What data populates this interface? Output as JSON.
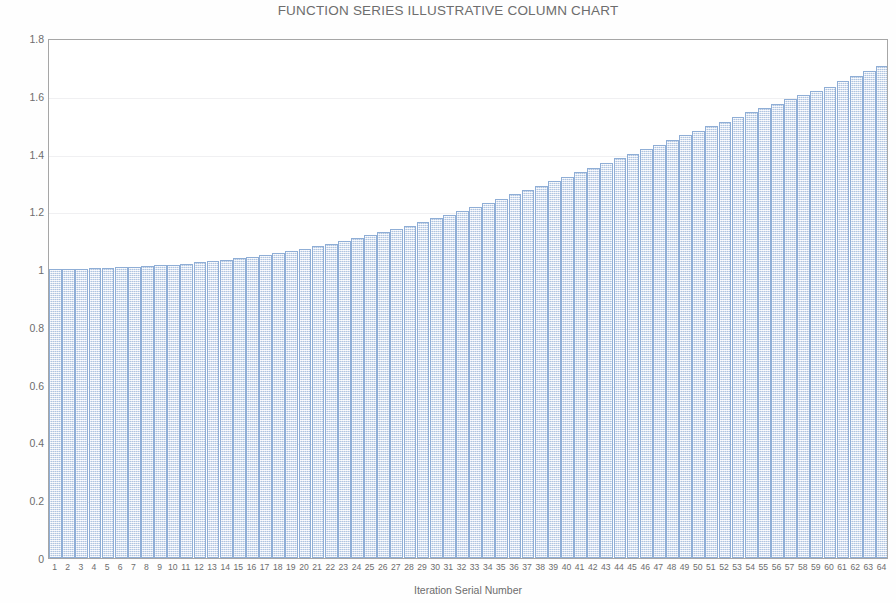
{
  "chart_data": {
    "type": "bar",
    "title": "FUNCTION SERIES ILLUSTRATIVE COLUMN CHART",
    "xlabel": "Iteration Serial Number",
    "ylabel": "Value of Iteration Kernel",
    "ylim": [
      0,
      1.8
    ],
    "ytick_labels": [
      "1.8",
      "1.6",
      "1.4",
      "1.2",
      "1",
      "0.8",
      "0.6",
      "0.4",
      "0.2",
      "0"
    ],
    "ytick_values": [
      1.8,
      1.6,
      1.4,
      1.2,
      1.0,
      0.8,
      0.6,
      0.4,
      0.2,
      0
    ],
    "grid": true,
    "legend": null,
    "legend_position": "none",
    "categories": [
      "1",
      "2",
      "3",
      "4",
      "5",
      "6",
      "7",
      "8",
      "9",
      "10",
      "11",
      "12",
      "13",
      "14",
      "15",
      "16",
      "17",
      "18",
      "19",
      "20",
      "21",
      "22",
      "23",
      "24",
      "25",
      "26",
      "27",
      "28",
      "29",
      "30",
      "31",
      "32",
      "33",
      "34",
      "35",
      "36",
      "37",
      "38",
      "39",
      "40",
      "41",
      "42",
      "43",
      "44",
      "45",
      "46",
      "47",
      "48",
      "49",
      "50",
      "51",
      "52",
      "53",
      "54",
      "55",
      "56",
      "57",
      "58",
      "59",
      "60",
      "61",
      "62",
      "63",
      "64"
    ],
    "values": [
      1.0,
      1.001,
      1.002,
      1.003,
      1.004,
      1.006,
      1.008,
      1.01,
      1.013,
      1.016,
      1.019,
      1.023,
      1.027,
      1.032,
      1.037,
      1.043,
      1.049,
      1.056,
      1.063,
      1.071,
      1.079,
      1.088,
      1.097,
      1.107,
      1.117,
      1.128,
      1.139,
      1.151,
      1.163,
      1.176,
      1.189,
      1.202,
      1.216,
      1.23,
      1.244,
      1.259,
      1.274,
      1.289,
      1.304,
      1.319,
      1.335,
      1.351,
      1.367,
      1.383,
      1.399,
      1.415,
      1.431,
      1.447,
      1.463,
      1.479,
      1.495,
      1.511,
      1.527,
      1.543,
      1.558,
      1.573,
      1.588,
      1.603,
      1.618,
      1.632,
      1.65,
      1.668,
      1.686,
      1.703
    ],
    "series_color": "#dde6f2",
    "series_border_color": "#8faed6"
  },
  "style": {
    "axis_color": "#a6a6a6",
    "grid_color": "#f0f0f2",
    "text_color": "#6d6d6d",
    "background": "#ffffff"
  }
}
